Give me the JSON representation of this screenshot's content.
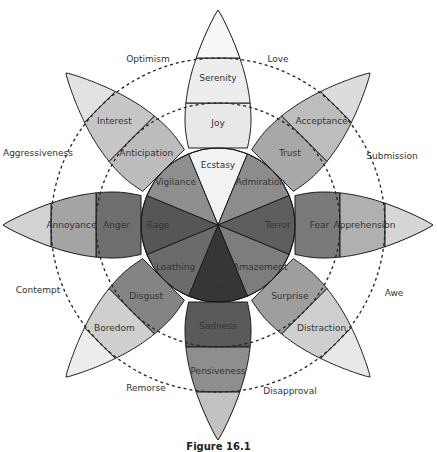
{
  "diagram": {
    "center": [
      218,
      225
    ],
    "radii": {
      "inner": 77,
      "middle": 122,
      "outer": 167,
      "tip": 215
    },
    "petal_half_width_deg": 22.5,
    "petals": [
      {
        "angle": -90,
        "intense": "Ecstasy",
        "basic": "Joy",
        "mild": "Serenity",
        "colors": [
          "#f2f2f2",
          "#e8e8e8",
          "#ededed",
          "#f7f7f7"
        ]
      },
      {
        "angle": -45,
        "intense": "Admiration",
        "basic": "Trust",
        "mild": "Acceptance",
        "colors": [
          "#8c8c8c",
          "#a8a8a8",
          "#bdbdbd",
          "#dcdcdc"
        ]
      },
      {
        "angle": 0,
        "intense": "Terror",
        "basic": "Fear",
        "mild": "Apprehension",
        "colors": [
          "#5e5e5e",
          "#7a7a7a",
          "#b0b0b0",
          "#d6d6d6"
        ]
      },
      {
        "angle": 45,
        "intense": "Amazement",
        "basic": "Surprise",
        "mild": "Distraction",
        "colors": [
          "#7d7d7d",
          "#9e9e9e",
          "#cfcfcf",
          "#e8e8e8"
        ]
      },
      {
        "angle": 90,
        "intense": "Grief",
        "basic": "Sadness",
        "mild": "Pensiveness",
        "colors": [
          "#363636",
          "#5a5a5a",
          "#8e8e8e",
          "#c2c2c2"
        ]
      },
      {
        "angle": 135,
        "intense": "Loathing",
        "basic": "Disgust",
        "mild": "Boredom",
        "colors": [
          "#6b6b6b",
          "#848484",
          "#cfcfcf",
          "#ededed"
        ]
      },
      {
        "angle": 180,
        "intense": "Rage",
        "basic": "Anger",
        "mild": "Annoyance",
        "colors": [
          "#565656",
          "#6e6e6e",
          "#a4a4a4",
          "#d2d2d2"
        ]
      },
      {
        "angle": -135,
        "intense": "Vigilance",
        "basic": "Anticipation",
        "mild": "Interest",
        "colors": [
          "#8e8e8e",
          "#bcbcbc",
          "#c6c6c6",
          "#e2e2e2"
        ]
      }
    ],
    "dyads": [
      {
        "label": "Love",
        "x": 278,
        "y": 59
      },
      {
        "label": "Submission",
        "x": 392,
        "y": 156
      },
      {
        "label": "Awe",
        "x": 394,
        "y": 293
      },
      {
        "label": "Disapproval",
        "x": 290,
        "y": 391
      },
      {
        "label": "Remorse",
        "x": 146,
        "y": 388
      },
      {
        "label": "Contempt",
        "x": 38,
        "y": 290
      },
      {
        "label": "Aggressiveness",
        "x": 38,
        "y": 153
      },
      {
        "label": "Optimism",
        "x": 148,
        "y": 59
      }
    ],
    "dashed_circles": [
      122,
      167
    ],
    "stroke_color": "#1a1a1a",
    "dash_color": "#222222"
  },
  "caption": "Figure 16.1"
}
